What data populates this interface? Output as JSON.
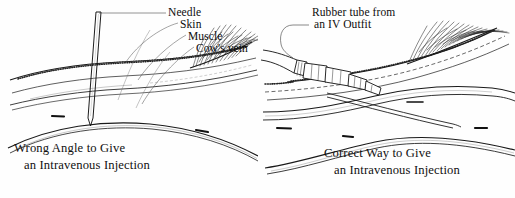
{
  "figure": {
    "background_color": "#fefefe",
    "ink_color": "#111111"
  },
  "left_panel": {
    "name": "wrong-angle-panel",
    "callouts": [
      {
        "id": "needle",
        "label": "Needle"
      },
      {
        "id": "skin",
        "label": "Skin"
      },
      {
        "id": "muscle",
        "label": "Muscle"
      },
      {
        "id": "cows_vein",
        "label": "Cow's vein"
      }
    ],
    "caption": {
      "line1": "Wrong Angle to Give",
      "line2": "an Intravenous Injection"
    }
  },
  "right_panel": {
    "name": "correct-way-panel",
    "callouts": [
      {
        "id": "rubber_tube",
        "line1": "Rubber tube from",
        "line2": "an IV Outfit"
      }
    ],
    "caption": {
      "line1": "Correct Way to Give",
      "line2": "an Intravenous Injection"
    }
  }
}
